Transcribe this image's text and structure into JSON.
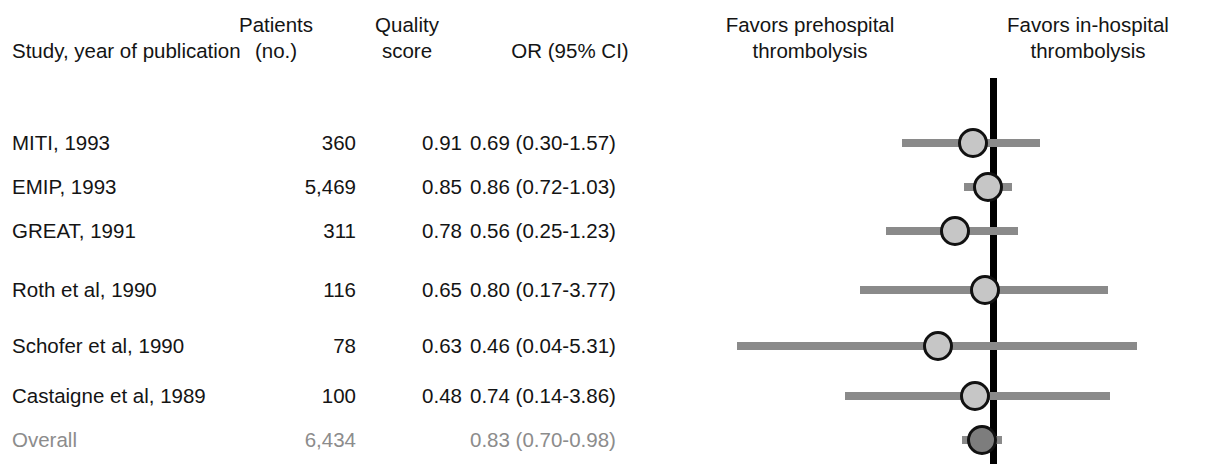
{
  "figure": {
    "type": "forest-plot",
    "title": "",
    "reference_line_value": 1.0
  },
  "header": {
    "study_label": "Study, year of publication",
    "patients_label_1": "Patients",
    "patients_label_2": "(no.)",
    "quality_label_1": "Quality",
    "quality_label_2": "score",
    "or_label": "OR (95% CI)",
    "favors_left_1": "Favors prehospital",
    "favors_left_2": "thrombolysis",
    "favors_right_1": "Favors in-hospital",
    "favors_right_2": "thrombolysis"
  },
  "colors": {
    "text": "#141414",
    "overall_text": "#8c8c8c",
    "ci_line": "#8a8a8a",
    "marker_fill": "#c6c6c6",
    "marker_overall_fill": "#7d7d7d",
    "marker_edge": "#111111",
    "reference_line": "#000000",
    "background": "#ffffff"
  },
  "rows": [
    {
      "study": "MITI, 1993",
      "patients": "360",
      "quality": "0.91",
      "or_ci": "0.69 (0.30-1.57)",
      "or": 0.69,
      "ci_low": 0.3,
      "ci_high": 1.57,
      "overall": false,
      "y": 143,
      "ci_x": 902,
      "ci_w": 138,
      "marker_x": 973
    },
    {
      "study": "EMIP, 1993",
      "patients": "5,469",
      "quality": "0.85",
      "or_ci": "0.86 (0.72-1.03)",
      "or": 0.86,
      "ci_low": 0.72,
      "ci_high": 1.03,
      "overall": false,
      "y": 187,
      "ci_x": 964,
      "ci_w": 48,
      "marker_x": 988
    },
    {
      "study": "GREAT, 1991",
      "patients": "311",
      "quality": "0.78",
      "or_ci": "0.56 (0.25-1.23)",
      "or": 0.56,
      "ci_low": 0.25,
      "ci_high": 1.23,
      "overall": false,
      "y": 231,
      "ci_x": 886,
      "ci_w": 132,
      "marker_x": 955
    },
    {
      "study": "Roth et al, 1990",
      "patients": "116",
      "quality": "0.65",
      "or_ci": "0.80 (0.17-3.77)",
      "or": 0.8,
      "ci_low": 0.17,
      "ci_high": 3.77,
      "overall": false,
      "y": 290,
      "ci_x": 860,
      "ci_w": 248,
      "marker_x": 985
    },
    {
      "study": "Schofer et al, 1990",
      "patients": "78",
      "quality": "0.63",
      "or_ci": "0.46 (0.04-5.31)",
      "or": 0.46,
      "ci_low": 0.04,
      "ci_high": 5.31,
      "overall": false,
      "y": 346,
      "ci_x": 737,
      "ci_w": 400,
      "marker_x": 938
    },
    {
      "study": "Castaigne et al, 1989",
      "patients": "100",
      "quality": "0.48",
      "or_ci": "0.74 (0.14-3.86)",
      "or": 0.74,
      "ci_low": 0.14,
      "ci_high": 3.86,
      "overall": false,
      "y": 396,
      "ci_x": 845,
      "ci_w": 265,
      "marker_x": 975
    },
    {
      "study": "Overall",
      "patients": "6,434",
      "quality": "",
      "or_ci": "0.83 (0.70-0.98)",
      "or": 0.83,
      "ci_low": 0.7,
      "ci_high": 0.98,
      "overall": true,
      "y": 440,
      "ci_x": 962,
      "ci_w": 40,
      "marker_x": 982
    }
  ],
  "chart_data": {
    "type": "forest",
    "title": "",
    "xlabel": "Odds ratio (95% CI)",
    "ylabel": "",
    "reference_line": 1.0,
    "xscale": "log",
    "grid": false,
    "legend": "none",
    "left_annotation": "Favors prehospital thrombolysis",
    "right_annotation": "Favors in-hospital thrombolysis",
    "columns": [
      "Study, year of publication",
      "Patients (no.)",
      "Quality score",
      "OR (95% CI)"
    ],
    "categories": [
      "MITI, 1993",
      "EMIP, 1993",
      "GREAT, 1991",
      "Roth et al, 1990",
      "Schofer et al, 1990",
      "Castaigne et al, 1989",
      "Overall"
    ],
    "values": [
      0.69,
      0.86,
      0.56,
      0.8,
      0.46,
      0.74,
      0.83
    ],
    "ci_low": [
      0.3,
      0.72,
      0.25,
      0.17,
      0.04,
      0.14,
      0.7
    ],
    "ci_high": [
      1.57,
      1.03,
      1.23,
      3.77,
      5.31,
      3.86,
      0.98
    ],
    "patients": [
      360,
      5469,
      311,
      116,
      78,
      100,
      6434
    ],
    "quality_score": [
      0.91,
      0.85,
      0.78,
      0.65,
      0.63,
      0.48,
      null
    ]
  }
}
